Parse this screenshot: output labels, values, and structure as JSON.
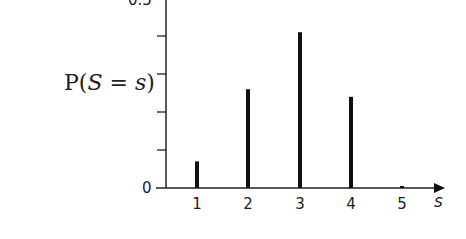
{
  "chart_data": {
    "type": "bar",
    "subtype": "stem",
    "title": "",
    "xlabel": "s",
    "ylabel": "P(S = s)",
    "categories": [
      "1",
      "2",
      "3",
      "4",
      "5"
    ],
    "values": [
      0.07,
      0.26,
      0.41,
      0.24,
      0.005
    ],
    "ylim": [
      0,
      0.5
    ],
    "y_ticks": [
      0,
      0.1,
      0.2,
      0.3,
      0.4,
      0.5
    ],
    "y_tick_labels_shown": [
      "0",
      "0.5"
    ],
    "grid": false,
    "legend": null,
    "bar_color": "#111111",
    "axis_color": "#222222"
  },
  "labels": {
    "y_axis_label_main": "P(",
    "y_axis_label_var": "S",
    "y_axis_label_eq": " = ",
    "y_axis_label_val": "s",
    "y_axis_label_close": ")",
    "y_zero": "0",
    "y_top": "0.5",
    "x_name": "s",
    "x_ticks": [
      "1",
      "2",
      "3",
      "4",
      "5"
    ]
  }
}
